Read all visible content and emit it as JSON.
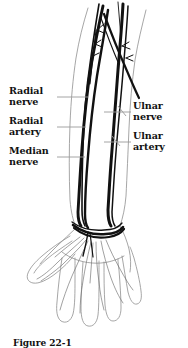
{
  "figure": {
    "caption": "Figure 22-1",
    "background_color": "#ffffff",
    "ink_color": "#111111",
    "outline_color": "#9a9a9a",
    "leader_color": "#9a9a9a"
  },
  "labels": {
    "left": [
      {
        "id": "radial-nerve",
        "line1": "Radial",
        "line2": "nerve",
        "text": "Radial nerve"
      },
      {
        "id": "radial-artery",
        "line1": "Radial",
        "line2": "artery",
        "text": "Radial artery"
      },
      {
        "id": "median-nerve",
        "line1": "Median",
        "line2": "nerve",
        "text": "Median nerve"
      }
    ],
    "right": [
      {
        "id": "ulnar-nerve",
        "line1": "Ulnar",
        "line2": "nerve",
        "text": "Ulnar nerve"
      },
      {
        "id": "ulnar-artery",
        "line1": "Ulnar",
        "line2": "artery",
        "text": "Ulnar artery"
      }
    ]
  },
  "structures": [
    "radial-nerve",
    "radial-artery",
    "median-nerve",
    "ulnar-nerve",
    "ulnar-artery",
    "forearm-outline",
    "hand-outline",
    "wrist-retinaculum",
    "thumb",
    "finger-index",
    "finger-middle",
    "finger-ring",
    "finger-little"
  ]
}
